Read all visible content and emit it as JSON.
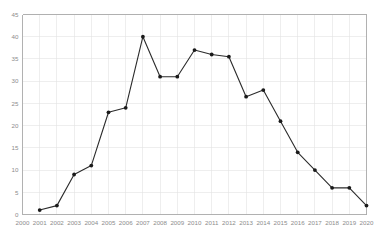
{
  "chart_data": {
    "type": "line",
    "title": "",
    "subtitle": "",
    "xlabel": "",
    "ylabel": "",
    "xlim": [
      2000,
      2020
    ],
    "ylim": [
      0,
      45
    ],
    "grid": true,
    "legend": "none",
    "x_ticks": [
      "2000",
      "2001",
      "2002",
      "2003",
      "2004",
      "2005",
      "2006",
      "2007",
      "2008",
      "2009",
      "2010",
      "2011",
      "2012",
      "2013",
      "2014",
      "2015",
      "2016",
      "2017",
      "2018",
      "2019",
      "2020"
    ],
    "y_ticks": [
      "0",
      "5",
      "10",
      "15",
      "20",
      "25",
      "30",
      "35",
      "40",
      "45"
    ],
    "series": [
      {
        "name": "series-1",
        "color": "#2b2b2b",
        "marker": "circle",
        "x": [
          2001,
          2002,
          2003,
          2004,
          2005,
          2006,
          2007,
          2008,
          2009,
          2010,
          2011,
          2012,
          2013,
          2014,
          2015,
          2016,
          2017,
          2018,
          2019,
          2020
        ],
        "values": [
          1,
          2,
          9,
          11,
          23,
          24,
          40,
          31,
          31,
          37,
          36,
          35.5,
          26.5,
          28,
          21,
          14,
          10,
          6,
          6,
          2
        ]
      }
    ],
    "points": [
      {
        "x": "2001",
        "y": 1
      },
      {
        "x": "2002",
        "y": 2
      },
      {
        "x": "2003",
        "y": 9
      },
      {
        "x": "2004",
        "y": 11
      },
      {
        "x": "2005",
        "y": 23
      },
      {
        "x": "2006",
        "y": 24
      },
      {
        "x": "2007",
        "y": 40
      },
      {
        "x": "2008",
        "y": 31
      },
      {
        "x": "2009",
        "y": 31
      },
      {
        "x": "2010",
        "y": 37
      },
      {
        "x": "2011",
        "y": 36
      },
      {
        "x": "2012",
        "y": 35.5
      },
      {
        "x": "2013",
        "y": 26.5
      },
      {
        "x": "2014",
        "y": 28
      },
      {
        "x": "2015",
        "y": 21
      },
      {
        "x": "2016",
        "y": 14
      },
      {
        "x": "2017",
        "y": 10
      },
      {
        "x": "2018",
        "y": 6
      },
      {
        "x": "2019",
        "y": 6
      },
      {
        "x": "2020",
        "y": 2
      }
    ],
    "colors": {
      "line": "#2b2b2b",
      "marker": "#1a1a1a",
      "grid": "#e2e2e2",
      "axis": "#a8a8a8",
      "tick_text": "#8c8c8c",
      "background": "#ffffff"
    }
  }
}
